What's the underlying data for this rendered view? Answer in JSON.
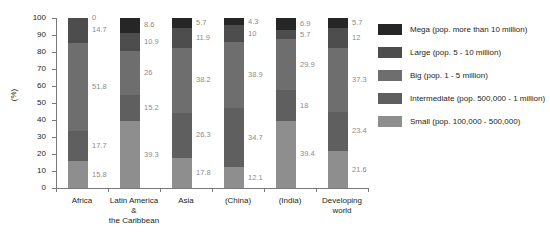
{
  "chart_data": {
    "type": "bar",
    "subtype": "stacked-percent",
    "title": "",
    "xlabel": "",
    "ylabel": "(%)",
    "ylim": [
      0,
      100
    ],
    "yticks": [
      0,
      10,
      20,
      30,
      40,
      50,
      60,
      70,
      80,
      90,
      100
    ],
    "grid": false,
    "legend_position": "right",
    "categories": [
      "Africa",
      "Latin America & the Caribbean",
      "Asia",
      "(China)",
      "(India)",
      "Developing world"
    ],
    "category_lines": [
      [
        "Africa"
      ],
      [
        "Latin America &",
        "the Caribbean"
      ],
      [
        "Asia"
      ],
      [
        "(China)"
      ],
      [
        "(India)"
      ],
      [
        "Developing world"
      ]
    ],
    "series": [
      {
        "name": "Mega (pop. more than 10 million)",
        "short_name": "Mega",
        "color": "#262626",
        "values": [
          0,
          8.6,
          5.7,
          4.3,
          6.9,
          5.7
        ],
        "labels": [
          "0",
          "8.6",
          "5.7",
          "4.3",
          "6.9",
          "5.7"
        ]
      },
      {
        "name": "Large (pop. 5 - 10 million)",
        "short_name": "Large",
        "color": "#4d4d4d",
        "values": [
          14.7,
          10.9,
          11.9,
          10,
          5.7,
          12
        ],
        "labels": [
          "14.7",
          "10.9",
          "11.9",
          "10",
          "5.7",
          "12"
        ]
      },
      {
        "name": "Big (pop. 1 - 5 million)",
        "short_name": "Big",
        "color": "#6e6e6e",
        "values": [
          51.8,
          26,
          38.2,
          38.9,
          29.9,
          37.3
        ],
        "labels": [
          "51.8",
          "26",
          "38.2",
          "38.9",
          "29.9",
          "37.3"
        ]
      },
      {
        "name": "Intermediate (pop. 500,000 - 1 million)",
        "short_name": "Intermediate",
        "color": "#5f5f5f",
        "values": [
          17.7,
          15.2,
          26.3,
          34.7,
          18,
          23.4
        ],
        "labels": [
          "17.7",
          "15.2",
          "26.3",
          "34.7",
          "18",
          "23.4"
        ]
      },
      {
        "name": "Small (pop. 100,000 - 500,000)",
        "short_name": "Small",
        "color": "#8e8e8e",
        "values": [
          15.8,
          39.3,
          17.9,
          12.1,
          39.5,
          21.6
        ],
        "labels": [
          "15.8",
          "39.3",
          "17.8",
          "12.1",
          "39.4",
          "21.6"
        ]
      }
    ]
  }
}
